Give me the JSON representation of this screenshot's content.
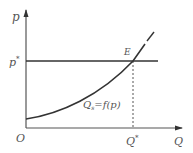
{
  "diagram": {
    "type": "supply-curve",
    "axes": {
      "y_label": "p",
      "x_label": "Q",
      "origin_label": "O"
    },
    "price_level": {
      "label": "p",
      "superscript": "*"
    },
    "quantity_level": {
      "label": "Q",
      "superscript": "*"
    },
    "equilibrium_point": {
      "label": "E"
    },
    "curve": {
      "label_main": "Q",
      "label_sub": "s",
      "label_rest": "=f(p)"
    },
    "colors": {
      "line": "#333333",
      "text": "#555555",
      "background": "#ffffff"
    }
  }
}
